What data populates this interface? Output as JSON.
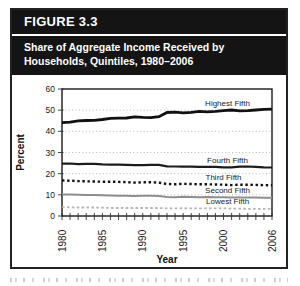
{
  "figure": {
    "number_label": "FIGURE 3.3",
    "title_line1": "Share of Aggregate Income Received by",
    "title_line2": "Households, Quintiles, 1980–2006"
  },
  "chart_data": {
    "type": "line",
    "title": "Share of Aggregate Income Received by Households, Quintiles, 1980–2006",
    "xlabel": "Year",
    "ylabel": "Percent",
    "ylim": [
      0,
      60
    ],
    "y_ticks": [
      0,
      10,
      20,
      30,
      40,
      50,
      60
    ],
    "x_ticks_labeled": [
      1980,
      1985,
      1990,
      1995,
      2000,
      2006
    ],
    "grid": "horizontal-dotted",
    "legend_position": "inline-labels-right",
    "frame": "full-box",
    "x": [
      1980,
      1981,
      1982,
      1983,
      1984,
      1985,
      1986,
      1987,
      1988,
      1989,
      1990,
      1991,
      1992,
      1993,
      1994,
      1995,
      1996,
      1997,
      1998,
      1999,
      2000,
      2001,
      2002,
      2003,
      2004,
      2005,
      2006
    ],
    "series": [
      {
        "name": "Highest Fifth",
        "color": "#111111",
        "line_style": "solid",
        "label_at": [
          2000.5,
          51.8
        ],
        "values": [
          44.1,
          44.3,
          45.0,
          45.1,
          45.2,
          45.6,
          46.1,
          46.2,
          46.3,
          46.8,
          46.6,
          46.5,
          46.9,
          48.9,
          49.1,
          48.7,
          49.0,
          49.4,
          49.2,
          49.4,
          49.8,
          50.1,
          49.7,
          49.8,
          50.1,
          50.4,
          50.5
        ]
      },
      {
        "name": "Fourth Fifth",
        "color": "#1c1c1c",
        "line_style": "solid",
        "label_at": [
          2000.5,
          25.2
        ],
        "values": [
          24.7,
          24.8,
          24.5,
          24.6,
          24.6,
          24.4,
          24.3,
          24.3,
          24.2,
          24.0,
          24.0,
          24.2,
          24.2,
          23.5,
          23.4,
          23.3,
          23.3,
          23.2,
          23.2,
          23.2,
          23.0,
          23.0,
          23.3,
          23.4,
          23.2,
          23.0,
          22.9
        ]
      },
      {
        "name": "Third Fifth",
        "color": "#111111",
        "line_style": "dotted",
        "label_at": [
          2000.0,
          17.0
        ],
        "values": [
          16.8,
          16.7,
          16.5,
          16.4,
          16.3,
          16.2,
          16.2,
          16.1,
          16.0,
          15.8,
          15.9,
          15.9,
          15.8,
          15.1,
          15.0,
          15.2,
          15.1,
          15.0,
          15.0,
          14.9,
          14.8,
          14.6,
          14.8,
          14.8,
          14.7,
          14.6,
          14.5
        ]
      },
      {
        "name": "Second Fifth",
        "color": "#8e8e8e",
        "line_style": "solid",
        "label_at": [
          2000.5,
          11.0
        ],
        "values": [
          10.2,
          10.1,
          10.0,
          9.9,
          9.9,
          9.8,
          9.7,
          9.6,
          9.6,
          9.5,
          9.6,
          9.6,
          9.4,
          9.0,
          8.9,
          9.1,
          9.0,
          8.9,
          9.0,
          8.9,
          8.9,
          8.7,
          8.8,
          8.7,
          8.7,
          8.6,
          8.6
        ]
      },
      {
        "name": "Lowest Fifth",
        "color": "#b5b5b5",
        "line_style": "dashed",
        "label_at": [
          2000.5,
          5.6
        ],
        "values": [
          4.2,
          4.1,
          4.0,
          4.0,
          4.0,
          3.9,
          3.8,
          3.8,
          3.8,
          3.8,
          3.8,
          3.8,
          3.8,
          3.6,
          3.6,
          3.7,
          3.6,
          3.6,
          3.6,
          3.6,
          3.6,
          3.5,
          3.5,
          3.4,
          3.4,
          3.4,
          3.4
        ]
      }
    ]
  }
}
